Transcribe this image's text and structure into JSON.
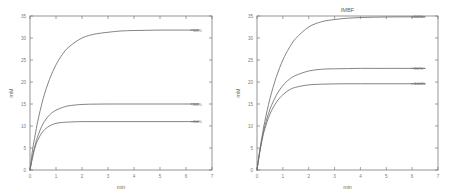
{
  "figure": {
    "background": "#ffffff",
    "line_color": "#6e6e6e",
    "axis_color": "#7a7a7a",
    "text_color": "#7b7b7b"
  },
  "chart_data": [
    {
      "type": "line",
      "panel": "left",
      "title": "",
      "xlabel": "min",
      "ylabel": "mM",
      "xlim": [
        0,
        7
      ],
      "ylim": [
        0,
        35
      ],
      "xticks": [
        0,
        1,
        2,
        3,
        4,
        5,
        6,
        7
      ],
      "xticklabels": [
        "0",
        "1",
        "2",
        "3",
        "4",
        "5",
        "6",
        "7"
      ],
      "yticks": [
        0,
        5,
        10,
        15,
        20,
        25,
        30,
        35
      ],
      "yticklabels": [
        "0",
        "5",
        "10",
        "15",
        "20",
        "25",
        "30",
        "35"
      ],
      "grid": false,
      "legend_position": "inline-right-of-curve",
      "series": [
        {
          "name": "10%",
          "label": "10%",
          "plateau": 31.8,
          "rate": 1.25,
          "x": [
            0,
            0.1,
            0.2,
            0.3,
            0.5,
            0.75,
            1.0,
            1.25,
            1.5,
            2.0,
            2.5,
            3.0,
            3.5,
            4.0,
            4.5,
            5.0,
            5.5,
            6.0,
            6.5
          ],
          "y": [
            0,
            4.6,
            8.0,
            11.1,
            16.1,
            20.6,
            23.9,
            26.3,
            28.0,
            30.0,
            30.9,
            31.3,
            31.6,
            31.7,
            31.75,
            31.8,
            31.8,
            31.8,
            31.8
          ]
        },
        {
          "name": "50%",
          "label": "50%",
          "plateau": 15.0,
          "rate": 2.4,
          "x": [
            0,
            0.1,
            0.2,
            0.3,
            0.5,
            0.75,
            1.0,
            1.25,
            1.5,
            2.0,
            2.5,
            3.0,
            3.5,
            4.0,
            4.5,
            5.0,
            5.5,
            6.0,
            6.5
          ],
          "y": [
            0,
            3.2,
            5.7,
            7.7,
            10.5,
            12.5,
            13.6,
            14.2,
            14.6,
            14.9,
            14.97,
            15.0,
            15.0,
            15.0,
            15.0,
            15.0,
            15.0,
            15.0,
            15.0
          ]
        },
        {
          "name": "90%",
          "label": "90%",
          "plateau": 11.0,
          "rate": 3.2,
          "x": [
            0,
            0.1,
            0.2,
            0.3,
            0.5,
            0.75,
            1.0,
            1.25,
            1.5,
            2.0,
            2.5,
            3.0,
            3.5,
            4.0,
            4.5,
            5.0,
            5.5,
            6.0,
            6.5
          ],
          "y": [
            0,
            2.9,
            5.2,
            6.8,
            8.8,
            10.0,
            10.6,
            10.8,
            10.9,
            11.0,
            11.0,
            11.0,
            11.0,
            11.0,
            11.0,
            11.0,
            11.0,
            11.0,
            11.0
          ]
        }
      ]
    },
    {
      "type": "line",
      "panel": "right",
      "title": "IMBF",
      "xlabel": "min",
      "ylabel": "mM",
      "xlim": [
        0,
        7
      ],
      "ylim": [
        0,
        35
      ],
      "xticks": [
        0,
        1,
        2,
        3,
        4,
        5,
        6,
        7
      ],
      "xticklabels": [
        "0",
        "1",
        "2",
        "3",
        "4",
        "5",
        "6",
        "7"
      ],
      "yticks": [
        0,
        5,
        10,
        15,
        20,
        25,
        30,
        35
      ],
      "yticklabels": [
        "0",
        "5",
        "10",
        "15",
        "20",
        "25",
        "30",
        "35"
      ],
      "grid": false,
      "legend_position": "inline-right-of-curve",
      "series": [
        {
          "name": "50%",
          "label": "50%",
          "plateau": 34.8,
          "rate": 1.1,
          "x": [
            0,
            0.1,
            0.2,
            0.3,
            0.5,
            0.75,
            1.0,
            1.25,
            1.5,
            2.0,
            2.5,
            3.0,
            3.5,
            4.0,
            4.5,
            5.0,
            5.5,
            6.0,
            6.5
          ],
          "y": [
            0,
            4.2,
            7.8,
            11.0,
            16.2,
            21.2,
            25.0,
            27.8,
            29.9,
            32.5,
            33.7,
            34.2,
            34.5,
            34.65,
            34.72,
            34.77,
            34.8,
            34.8,
            34.8
          ]
        },
        {
          "name": "80%",
          "label": "80%",
          "plateau": 23.1,
          "rate": 1.75,
          "x": [
            0,
            0.1,
            0.2,
            0.3,
            0.5,
            0.75,
            1.0,
            1.25,
            1.5,
            2.0,
            2.5,
            3.0,
            3.5,
            4.0,
            4.5,
            5.0,
            5.5,
            6.0,
            6.5
          ],
          "y": [
            0,
            4.0,
            7.2,
            9.9,
            13.8,
            17.0,
            19.2,
            20.6,
            21.5,
            22.5,
            22.9,
            23.0,
            23.05,
            23.1,
            23.1,
            23.1,
            23.1,
            23.1,
            23.1
          ]
        },
        {
          "name": "100%",
          "label": "100%",
          "plateau": 19.6,
          "rate": 2.2,
          "x": [
            0,
            0.1,
            0.2,
            0.3,
            0.5,
            0.75,
            1.0,
            1.25,
            1.5,
            2.0,
            2.5,
            3.0,
            3.5,
            4.0,
            4.5,
            5.0,
            5.5,
            6.0,
            6.5
          ],
          "y": [
            0,
            3.8,
            6.9,
            9.3,
            12.7,
            15.4,
            17.1,
            18.2,
            18.8,
            19.35,
            19.5,
            19.57,
            19.6,
            19.6,
            19.6,
            19.6,
            19.6,
            19.6,
            19.6
          ]
        }
      ]
    }
  ]
}
